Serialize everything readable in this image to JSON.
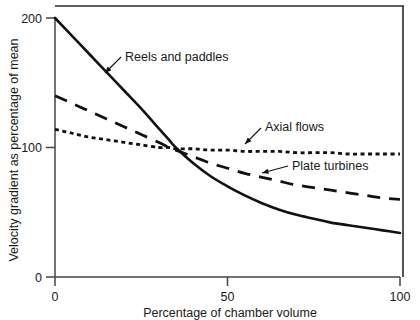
{
  "chart_data": {
    "type": "line",
    "title": "",
    "xlabel": "Percentage of chamber volume",
    "ylabel": "Velocity gradient as percentage of mean",
    "xlim": [
      0,
      100
    ],
    "ylim": [
      0,
      200
    ],
    "xticks": [
      0,
      50,
      100
    ],
    "xticklabels": [
      "0",
      "50",
      "100"
    ],
    "yticks": [
      0,
      100,
      200
    ],
    "yticklabels": [
      "0",
      "100",
      "200"
    ],
    "grid": false,
    "legend_position": "inline-annotations",
    "series": [
      {
        "name": "Reels and paddles",
        "style": "solid",
        "color": "#111111",
        "x": [
          0,
          5,
          10,
          15,
          20,
          25,
          30,
          33,
          35,
          40,
          45,
          50,
          55,
          60,
          65,
          70,
          75,
          80,
          85,
          90,
          95,
          100
        ],
        "values": [
          200,
          186,
          172,
          158,
          144,
          130,
          115,
          106,
          100,
          88,
          78,
          70,
          63,
          57,
          52,
          48,
          45,
          42,
          40,
          38,
          36,
          34
        ]
      },
      {
        "name": "Plate turbines",
        "style": "dashed",
        "color": "#111111",
        "x": [
          0,
          5,
          10,
          15,
          20,
          25,
          30,
          33,
          35,
          40,
          45,
          50,
          55,
          60,
          65,
          70,
          75,
          80,
          85,
          90,
          95,
          100
        ],
        "values": [
          140,
          134,
          128,
          122,
          116,
          110,
          104,
          100,
          98,
          93,
          88,
          84,
          80,
          77,
          74,
          71,
          69,
          67,
          65,
          63,
          61,
          60
        ]
      },
      {
        "name": "Axial flows",
        "style": "dotted",
        "color": "#111111",
        "x": [
          0,
          5,
          10,
          15,
          20,
          25,
          30,
          33,
          35,
          40,
          45,
          50,
          55,
          60,
          65,
          70,
          75,
          80,
          85,
          90,
          95,
          100
        ],
        "values": [
          114,
          111,
          108,
          106,
          104,
          102,
          100,
          100,
          99,
          99,
          98,
          98,
          97,
          97,
          97,
          96,
          96,
          96,
          95,
          95,
          95,
          95
        ]
      }
    ],
    "annotations": [
      {
        "text": "Reels and paddles",
        "text_x": 125,
        "text_y": 61,
        "leader_from_x": 121,
        "leader_from_y": 57,
        "leader_to_x": 105,
        "leader_to_y": 73
      },
      {
        "text": "Axial flows",
        "text_x": 265,
        "text_y": 131,
        "leader_from_x": 261,
        "leader_from_y": 128,
        "leader_to_x": 245,
        "leader_to_y": 144
      },
      {
        "text": "Plate turbines",
        "text_x": 292,
        "text_y": 170,
        "leader_from_x": 288,
        "leader_from_y": 166,
        "leader_to_x": 262,
        "leader_to_y": 173
      }
    ]
  },
  "axes": {
    "x_axis_title": "Percentage of chamber volume",
    "y_axis_title": "Velocity gradient as percentage of mean",
    "x_tick_0": "0",
    "x_tick_50": "50",
    "x_tick_100": "100",
    "y_tick_0": "0",
    "y_tick_100": "100",
    "y_tick_200": "200"
  },
  "series_labels": {
    "reels_and_paddles": "Reels and paddles",
    "axial_flows": "Axial flows",
    "plate_turbines": "Plate turbines"
  },
  "colors": {
    "ink": "#111111",
    "axis": "#444444",
    "background": "#ffffff"
  }
}
